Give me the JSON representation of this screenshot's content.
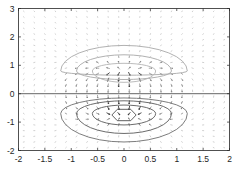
{
  "chart_data": {
    "type": "contour+quiver",
    "title": "",
    "xlabel": "",
    "ylabel": "",
    "xlim": [
      -2,
      2
    ],
    "ylim": [
      -2,
      3
    ],
    "grid": false,
    "legend": null,
    "x_ticks": [
      -2,
      -1.5,
      -1,
      -0.5,
      0,
      0.5,
      1,
      1.5,
      2
    ],
    "x_tick_labels": [
      "-2",
      "-1.5",
      "-1",
      "-0.5",
      "0",
      "0.5",
      "1",
      "1.5",
      "2"
    ],
    "y_ticks": [
      -2,
      -1,
      0,
      1,
      2,
      3
    ],
    "y_tick_labels": [
      "-2",
      "-1",
      "0",
      "1",
      "2",
      "3"
    ],
    "reference_line": {
      "y": 0,
      "description": "horizontal line at y=0 spanning full width"
    },
    "quiver": {
      "grid_x_step": 0.2,
      "grid_y_step": 0.2,
      "description": "vector field of a dipole-like potential; strongest arrows near origin pointing downward (from positive lobe above y=0 toward negative lobe below)",
      "source_center": [
        0,
        0.8
      ],
      "sink_center": [
        0,
        -0.75
      ]
    },
    "contours": [
      {
        "group": "upper",
        "level": "positive-1",
        "center": [
          0,
          0.8
        ],
        "rx": 1.2,
        "ry_top": 0.9,
        "ry_bottom": 0.15,
        "color": "#a8a8a8"
      },
      {
        "group": "upper",
        "level": "positive-2",
        "center": [
          0,
          0.8
        ],
        "rx": 0.9,
        "ry_top": 0.57,
        "ry_bottom": 0.3,
        "color": "#a8a8a8"
      },
      {
        "group": "upper",
        "level": "positive-3",
        "center": [
          0,
          0.8
        ],
        "rx": 0.6,
        "ry_top": 0.27,
        "ry_bottom": 0.4,
        "color": "#b4b4b4"
      },
      {
        "group": "lower",
        "level": "negative-1",
        "center": [
          0,
          -0.7
        ],
        "rx": 1.2,
        "ry_top": 0.55,
        "ry_bottom": 1.0,
        "color": "#6e6e6e"
      },
      {
        "group": "lower",
        "level": "negative-2",
        "center": [
          0,
          -0.7
        ],
        "rx": 0.9,
        "ry_top": 0.45,
        "ry_bottom": 0.7,
        "color": "#5a5a5a"
      },
      {
        "group": "lower",
        "level": "negative-3",
        "center": [
          0,
          -0.7
        ],
        "rx": 0.6,
        "ry_top": 0.3,
        "ry_bottom": 0.4,
        "color": "#5a5a5a"
      },
      {
        "group": "lower",
        "level": "negative-4",
        "center": [
          0,
          -0.75
        ],
        "rx": 0.23,
        "ry_top": 0.2,
        "ry_bottom": 0.2,
        "color": "#505050",
        "shape": "hexagon"
      }
    ]
  },
  "layout": {
    "plot_left": 18.5,
    "plot_right": 229.5,
    "plot_top": 8.5,
    "plot_bottom": 150.5
  }
}
